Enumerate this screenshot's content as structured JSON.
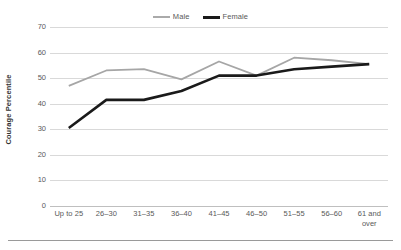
{
  "chart_data": {
    "type": "line",
    "title": "",
    "xlabel": "",
    "ylabel": "Courage Percentile",
    "categories": [
      "Up to 25",
      "26–30",
      "31–35",
      "36–40",
      "41–45",
      "46–50",
      "51–55",
      "56–60",
      "61 and over"
    ],
    "ylim": [
      0,
      70
    ],
    "ytick_step": 10,
    "yticks": [
      70,
      60,
      50,
      40,
      30,
      20,
      10,
      0
    ],
    "grid": "horizontal",
    "legend_position": "top-center",
    "series": [
      {
        "name": "Male",
        "color": "#a6a6a6",
        "values": [
          47,
          53,
          53.5,
          49.5,
          56.5,
          51,
          58,
          57,
          55.5
        ]
      },
      {
        "name": "Female",
        "color": "#1a1a1a",
        "values": [
          30.5,
          41.5,
          41.5,
          45,
          51,
          51,
          53.5,
          54.5,
          55.5
        ]
      }
    ]
  },
  "legend": {
    "entries": [
      {
        "label": "Male"
      },
      {
        "label": "Female"
      }
    ]
  },
  "axes": {
    "y_title": "Courage Percentile",
    "y_tick_labels": [
      "70",
      "60",
      "50",
      "40",
      "30",
      "20",
      "10",
      "0"
    ],
    "x_tick_labels": [
      "Up to 25",
      "26–30",
      "31–35",
      "36–40",
      "41–45",
      "46–50",
      "51–55",
      "56–60",
      "61 and over"
    ]
  },
  "colors": {
    "male_line": "#a6a6a6",
    "female_line": "#1a1a1a",
    "gridline": "#d9d9d9",
    "text": "#595959",
    "footer_rule": "#9a9a9a"
  }
}
